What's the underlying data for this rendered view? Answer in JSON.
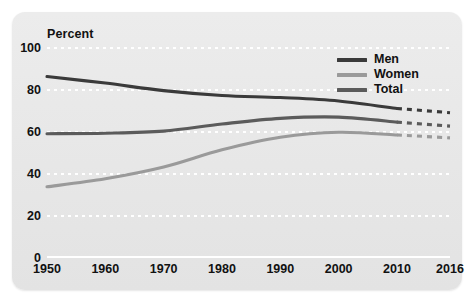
{
  "chart_data": {
    "type": "line",
    "title": "",
    "xlabel": "",
    "ylabel": "Percent",
    "ylim": [
      0,
      100
    ],
    "ytick_labels": [
      "0",
      "20",
      "40",
      "60",
      "80",
      "100"
    ],
    "ytick_values": [
      0,
      20,
      40,
      60,
      80,
      100
    ],
    "xtick_labels": [
      "1950",
      "1960",
      "1970",
      "1980",
      "1990",
      "2000",
      "2010",
      "2016"
    ],
    "xtick_values": [
      1950,
      1960,
      1970,
      1980,
      1990,
      2000,
      2010,
      2016
    ],
    "x": [
      1950,
      1960,
      1970,
      1980,
      1990,
      2000,
      2010,
      2016
    ],
    "grid": true,
    "grid_style": "dotted-white-horizontal",
    "legend_position": "top-right",
    "projection_note": "segments from 2010 to 2016 are drawn dotted (projected)",
    "series": [
      {
        "name": "Men",
        "color": "#3a3a3a",
        "values": [
          86.4,
          83.3,
          79.7,
          77.4,
          76.4,
          74.8,
          71.2,
          69.2
        ],
        "solid_until": 2010
      },
      {
        "name": "Women",
        "color": "#9a9a9a",
        "values": [
          33.9,
          37.7,
          43.3,
          51.5,
          57.5,
          59.9,
          58.6,
          57.2
        ],
        "solid_until": 2010
      },
      {
        "name": "Total",
        "color": "#5b5b5b",
        "values": [
          59.2,
          59.4,
          60.4,
          63.8,
          66.5,
          67.1,
          64.7,
          62.8
        ],
        "solid_until": 2010
      }
    ]
  },
  "legend": {
    "items": [
      {
        "label": "Men",
        "color": "#3a3a3a"
      },
      {
        "label": "Women",
        "color": "#9a9a9a"
      },
      {
        "label": "Total",
        "color": "#5b5b5b"
      }
    ]
  },
  "colors": {
    "card_background": "#e9e9e9",
    "page_background": "#ffffff",
    "gridline": "#ffffff",
    "text": "#111111",
    "men": "#3a3a3a",
    "women": "#9a9a9a",
    "total": "#5b5b5b"
  }
}
